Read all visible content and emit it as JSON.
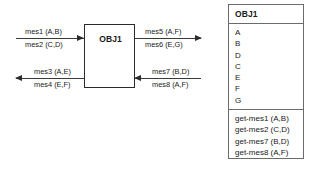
{
  "diagram": {
    "center_object": {
      "name": "OBJ1"
    },
    "messages": {
      "in_top": {
        "line1": "mes1 (A,B)",
        "line2": "mes2 (C,D)",
        "direction": "right"
      },
      "out_bottom": {
        "line1": "mes3 (A,E)",
        "line2": "mes4 (E,F)",
        "direction": "left"
      },
      "out_top": {
        "line1": "mes5 (A,F)",
        "line2": "mes6 (E,G)",
        "direction": "right"
      },
      "in_bottom": {
        "line1": "mes7 (B,D)",
        "line2": "mes8 (A,F)",
        "direction": "left"
      }
    },
    "class_panel": {
      "header": "OBJ1",
      "attributes": [
        "A",
        "B",
        "D",
        "C",
        "E",
        "F",
        "G"
      ],
      "operations": [
        "get-mes1 (A,B)",
        "get-mes2 (C,D)",
        "get-mes7 (B,D)",
        "get-mes8 (A,F)"
      ]
    },
    "colors": {
      "background": "#ffffff",
      "stroke": "#2b2b2b",
      "panel_stroke": "#6b6b6b",
      "text": "#1a1a1a"
    }
  }
}
